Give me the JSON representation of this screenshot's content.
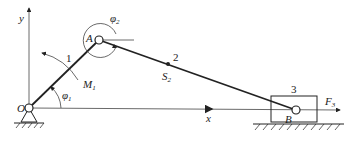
{
  "diagram": {
    "type": "slider-crank mechanism",
    "labels": {
      "y_axis": "y",
      "x_axis": "x",
      "origin": "O",
      "joint_a": "A",
      "joint_b": "B",
      "link1": "1",
      "link2": "2",
      "link3": "3",
      "phi1": "φ",
      "phi1_sub": "1",
      "phi2": "φ",
      "phi2_sub": "2",
      "moment": "M",
      "moment_sub": "1",
      "com": "S",
      "com_sub": "2",
      "force": "F",
      "force_sub": "3"
    },
    "colors": {
      "line": "#222222",
      "background": "#ffffff"
    }
  }
}
